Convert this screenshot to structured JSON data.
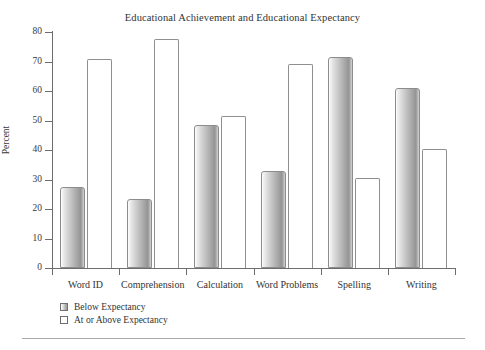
{
  "chart_data": {
    "type": "bar",
    "title": "Educational Achievement and Educational Expectancy",
    "xlabel": "",
    "ylabel": "Percent",
    "ylim": [
      0,
      80
    ],
    "yticks": [
      0,
      10,
      20,
      30,
      40,
      50,
      60,
      70,
      80
    ],
    "grid": false,
    "legend_position": "below-plot-left",
    "categories": [
      "Word ID",
      "Comprehension",
      "Calculation",
      "Word Problems",
      "Spelling",
      "Writing"
    ],
    "series": [
      {
        "name": "Below Expectancy",
        "values": [
          27.5,
          23.5,
          48.5,
          33,
          71.5,
          61
        ]
      },
      {
        "name": "At or Above Expectancy",
        "values": [
          71,
          77.5,
          51.5,
          69,
          30.5,
          40.5
        ]
      }
    ]
  },
  "legend": {
    "items": [
      {
        "label": "Below Expectancy",
        "swatch": "gray-gradient"
      },
      {
        "label": "At or Above Expectancy",
        "swatch": "white"
      }
    ]
  }
}
